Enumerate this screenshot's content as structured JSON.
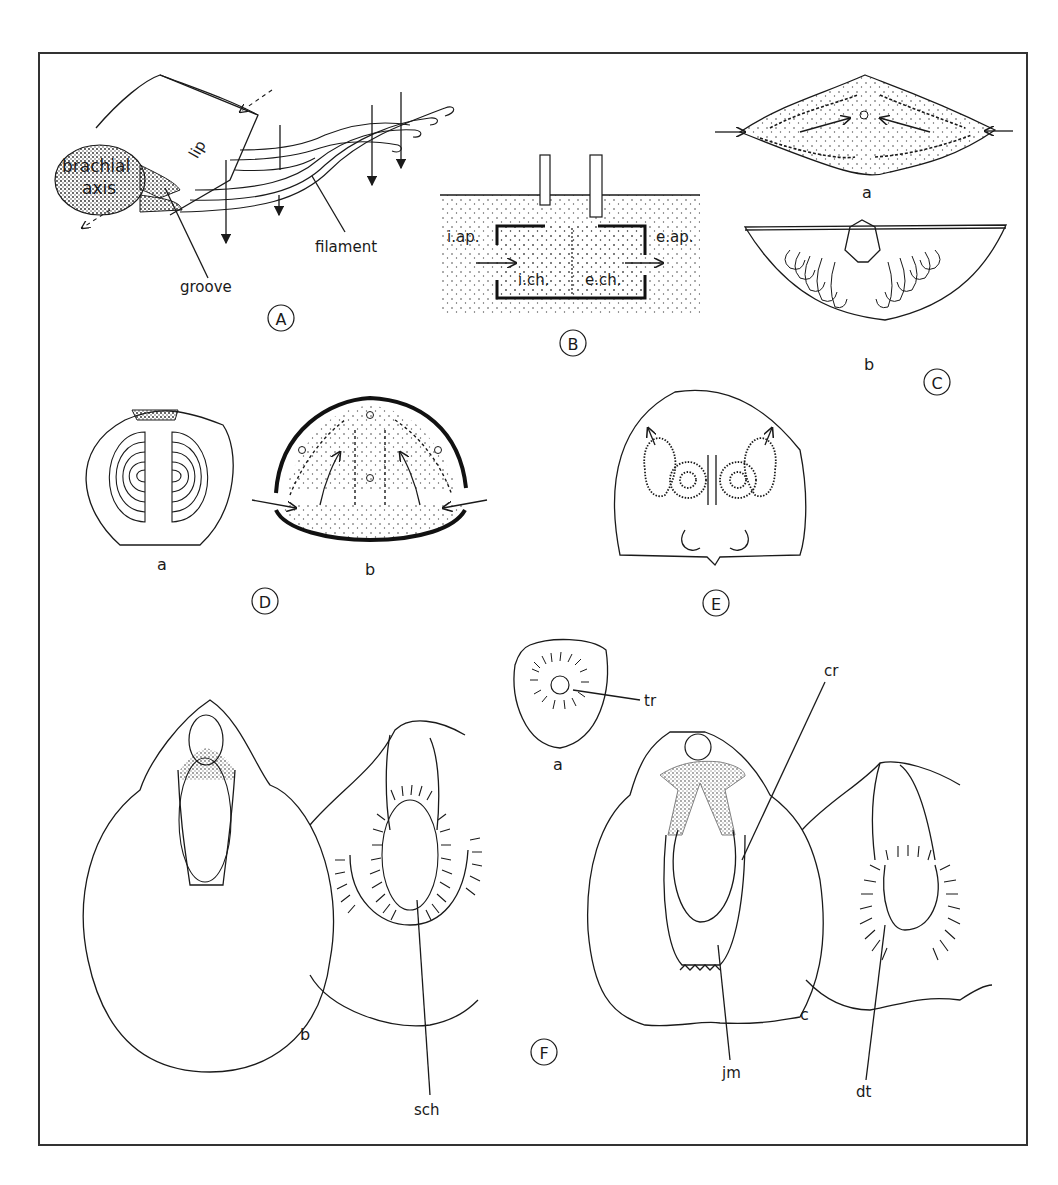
{
  "figure": {
    "panels": [
      {
        "id": "A",
        "labels": {
          "lip": "lip",
          "axis_line1": "brachial",
          "axis_line2": "axis",
          "groove": "groove",
          "filament": "filament"
        }
      },
      {
        "id": "B",
        "labels": {
          "inhalant_aperture": "i.ap.",
          "exhalant_aperture": "e.ap.",
          "inhalant_chamber": "i.ch.",
          "exhalant_chamber": "e.ch."
        }
      },
      {
        "id": "C",
        "sublabels": [
          "a",
          "b"
        ]
      },
      {
        "id": "D",
        "sublabels": [
          "a",
          "b"
        ]
      },
      {
        "id": "E"
      },
      {
        "id": "F",
        "sublabels": [
          "a",
          "b",
          "c"
        ],
        "labels": {
          "tr": "tr",
          "cr": "cr",
          "sch": "sch",
          "jm": "jm",
          "dt": "dt"
        }
      }
    ],
    "colors": {
      "ink": "#1a1a1a",
      "paper": "#ffffff",
      "frame": "#333333"
    }
  }
}
